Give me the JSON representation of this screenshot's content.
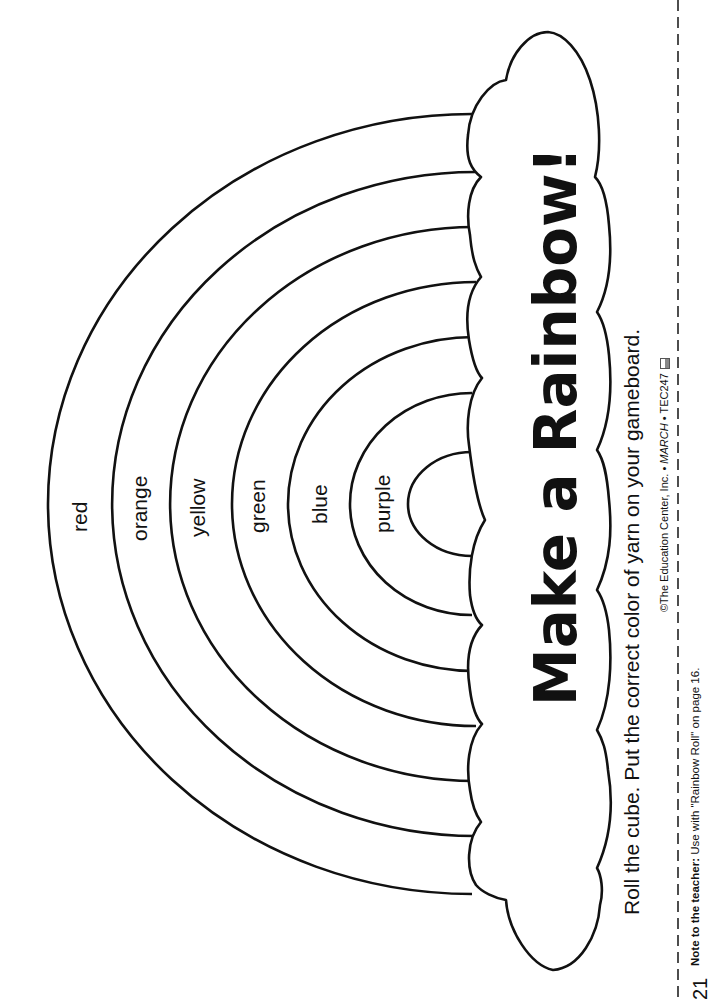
{
  "worksheet": {
    "title": "Make a Rainbow!",
    "instruction": "Roll the cube. Put the correct color of yarn on your gameboard.",
    "bands": [
      {
        "label": "red"
      },
      {
        "label": "orange"
      },
      {
        "label": "yellow"
      },
      {
        "label": "green"
      },
      {
        "label": "blue"
      },
      {
        "label": "purple"
      }
    ],
    "copyright": {
      "prefix": "©The Education Center, Inc. • ",
      "issue": "MARCH",
      "suffix": " • TEC247",
      "icon": "book-icon"
    },
    "note": {
      "label": "Note to the teacher:",
      "text": " Use with \"Rainbow Roll\" on page 16."
    },
    "page_number": "21",
    "colors": {
      "line": "#111111",
      "background": "#ffffff"
    }
  }
}
